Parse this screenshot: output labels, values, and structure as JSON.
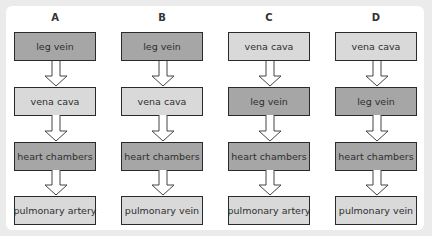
{
  "diagram": {
    "columns": [
      {
        "label": "A",
        "boxes": [
          {
            "text": "leg vein",
            "shade": "dark"
          },
          {
            "text": "vena cava",
            "shade": "light"
          },
          {
            "text": "heart chambers",
            "shade": "dark"
          },
          {
            "text": "pulmonary artery",
            "shade": "light"
          }
        ]
      },
      {
        "label": "B",
        "boxes": [
          {
            "text": "leg vein",
            "shade": "dark"
          },
          {
            "text": "vena cava",
            "shade": "light"
          },
          {
            "text": "heart chambers",
            "shade": "dark"
          },
          {
            "text": "pulmonary vein",
            "shade": "light"
          }
        ]
      },
      {
        "label": "C",
        "boxes": [
          {
            "text": "vena cava",
            "shade": "light"
          },
          {
            "text": "leg vein",
            "shade": "dark"
          },
          {
            "text": "heart chambers",
            "shade": "dark"
          },
          {
            "text": "pulmonary artery",
            "shade": "light"
          }
        ]
      },
      {
        "label": "D",
        "boxes": [
          {
            "text": "vena cava",
            "shade": "light"
          },
          {
            "text": "leg vein",
            "shade": "dark"
          },
          {
            "text": "heart chambers",
            "shade": "dark"
          },
          {
            "text": "pulmonary vein",
            "shade": "light"
          }
        ]
      }
    ],
    "colors": {
      "dark_box": "#a6a6a6",
      "light_box": "#d9d9d9",
      "border": "#2a2a2a",
      "background": "#ebebeb",
      "panel": "#ffffff"
    },
    "arrow_icon": "down-hollow-arrow"
  }
}
